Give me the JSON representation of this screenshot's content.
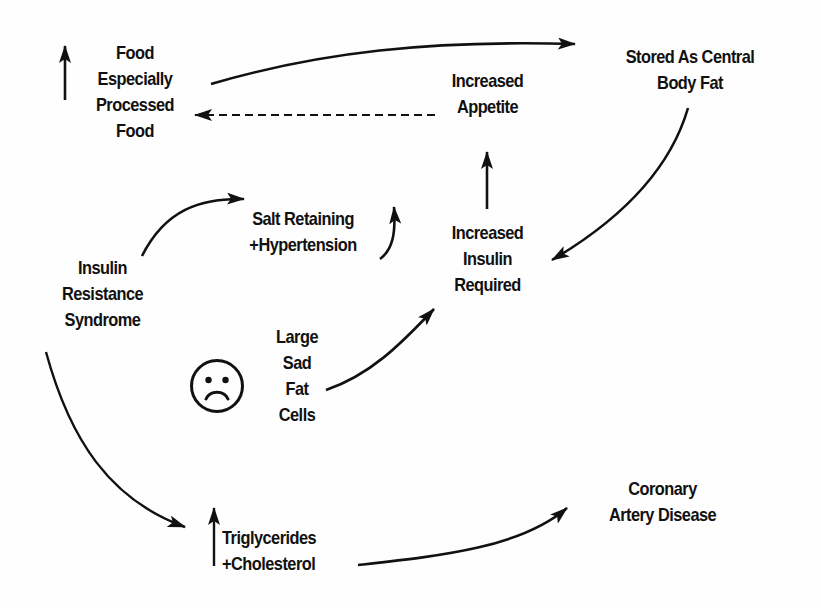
{
  "diagram": {
    "type": "flow-cycle",
    "nodes": {
      "food": {
        "lines": [
          "Food",
          "Especially",
          "Processed",
          "Food"
        ],
        "indicator": "up-arrow (increase)"
      },
      "stored_fat": {
        "lines": [
          "Stored As Central",
          "Body Fat"
        ]
      },
      "appetite": {
        "lines": [
          "Increased",
          "Appetite"
        ]
      },
      "insulin_required": {
        "lines": [
          "Increased",
          "Insulin",
          "Required"
        ]
      },
      "salt": {
        "lines": [
          "Salt Retaining",
          "+Hypertension"
        ]
      },
      "irs": {
        "lines": [
          "Insulin",
          "Resistance",
          "Syndrome"
        ]
      },
      "fat_cells": {
        "lines": [
          "Large",
          "Sad",
          "Fat",
          "Cells"
        ],
        "icon": "sad-face-icon"
      },
      "lipids": {
        "lines": [
          "Triglycerides",
          "+Cholesterol"
        ],
        "indicator": "up-arrow (increase)"
      },
      "cad": {
        "lines": [
          "Coronary",
          "Artery Disease"
        ]
      }
    },
    "edges": [
      {
        "from": "food",
        "to": "stored_fat",
        "style": "solid"
      },
      {
        "from": "stored_fat",
        "to": "insulin_required",
        "style": "solid"
      },
      {
        "from": "insulin_required",
        "to": "appetite",
        "style": "solid"
      },
      {
        "from": "appetite",
        "to": "food",
        "style": "dashed"
      },
      {
        "from": "irs",
        "to": "salt",
        "style": "solid"
      },
      {
        "from": "salt",
        "to": "up (increase)",
        "style": "solid"
      },
      {
        "from": "fat_cells",
        "to": "insulin_required",
        "style": "solid"
      },
      {
        "from": "irs",
        "to": "lipids",
        "style": "solid"
      },
      {
        "from": "lipids",
        "to": "cad",
        "style": "solid"
      }
    ],
    "colors": {
      "ink": "#111111",
      "background": "#fefefe"
    }
  }
}
